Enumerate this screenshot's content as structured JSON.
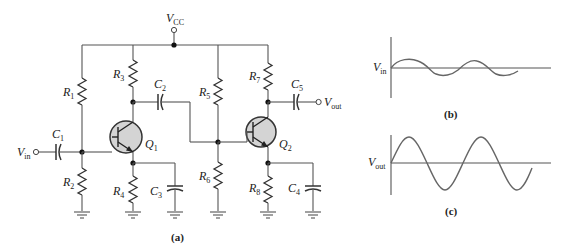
{
  "figure": {
    "panels": [
      {
        "id": "a",
        "caption": "(a)",
        "description": "Two-stage capacitor-coupled common-emitter BJT amplifier"
      },
      {
        "id": "b",
        "caption": "(b)",
        "description": "Input waveform"
      },
      {
        "id": "c",
        "caption": "(c)",
        "description": "Output waveform"
      }
    ]
  },
  "circuit": {
    "supply": {
      "main": "V",
      "sub": "CC"
    },
    "input": {
      "main": "V",
      "sub": "in"
    },
    "output": {
      "main": "V",
      "sub": "out"
    },
    "resistors": [
      {
        "main": "R",
        "sub": "1"
      },
      {
        "main": "R",
        "sub": "2"
      },
      {
        "main": "R",
        "sub": "3"
      },
      {
        "main": "R",
        "sub": "4"
      },
      {
        "main": "R",
        "sub": "5"
      },
      {
        "main": "R",
        "sub": "6"
      },
      {
        "main": "R",
        "sub": "7"
      },
      {
        "main": "R",
        "sub": "8"
      }
    ],
    "capacitors": [
      {
        "main": "C",
        "sub": "1"
      },
      {
        "main": "C",
        "sub": "2"
      },
      {
        "main": "C",
        "sub": "3"
      },
      {
        "main": "C",
        "sub": "4"
      },
      {
        "main": "C",
        "sub": "5"
      }
    ],
    "transistors": [
      {
        "main": "Q",
        "sub": "1"
      },
      {
        "main": "Q",
        "sub": "2"
      }
    ],
    "caption": "(a)"
  },
  "waveforms": {
    "input": {
      "label_main": "V",
      "label_sub": "in",
      "caption": "(b)",
      "amplitude": "small",
      "cycles": 2
    },
    "output": {
      "label_main": "V",
      "label_sub": "out",
      "caption": "(c)",
      "amplitude": "large",
      "cycles": 2
    }
  },
  "colors": {
    "wire": "#555555",
    "transistor_fill": "#d4d4d4",
    "waveform": "#666666",
    "background": "#ffffff"
  }
}
